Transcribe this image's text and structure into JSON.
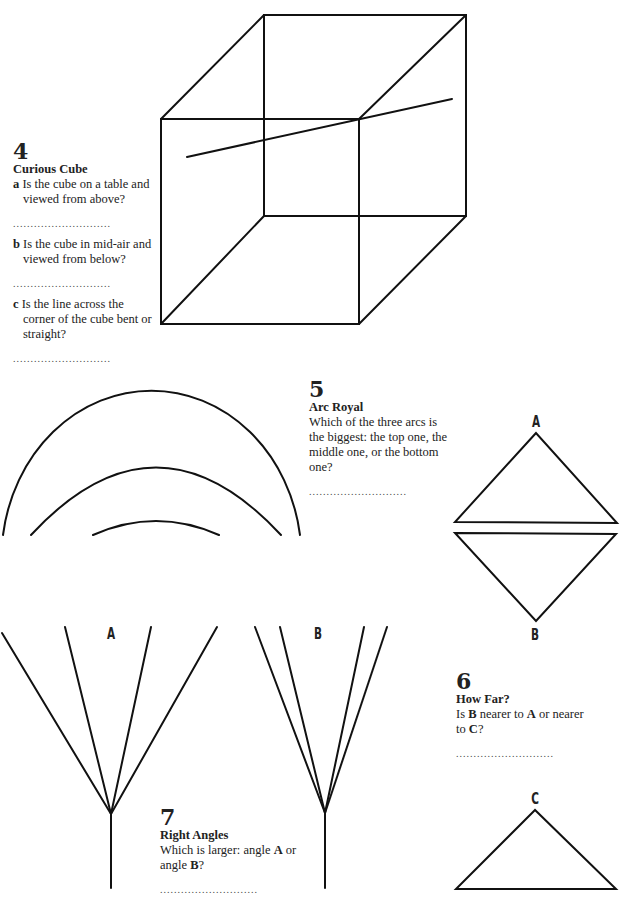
{
  "puzzles": {
    "p4": {
      "number": "4",
      "title": "Curious Cube",
      "questions": [
        {
          "letter": "a",
          "text": "Is the cube on a table and viewed from above?"
        },
        {
          "letter": "b",
          "text": "Is the cube in mid-air and viewed from below?"
        },
        {
          "letter": "c",
          "text": "Is the line across the corner of the cube bent or straight?"
        }
      ],
      "answer_line": "............................"
    },
    "p5": {
      "number": "5",
      "title": "Arc Royal",
      "question": "Which of the three arcs is the biggest: the top one, the middle one, or the bottom one?",
      "answer_line": "............................"
    },
    "p6": {
      "number": "6",
      "title": "How Far?",
      "question_parts": [
        "Is ",
        "B",
        " nearer to ",
        "A",
        " or nearer to ",
        "C",
        "?"
      ],
      "answer_line": "............................",
      "labels": {
        "a": "A",
        "b": "B",
        "c": "C"
      }
    },
    "p7": {
      "number": "7",
      "title": "Right Angles",
      "question_parts": [
        "Which is larger: angle ",
        "A",
        " or angle ",
        "B",
        "?"
      ],
      "answer_line": "............................",
      "labels": {
        "a": "A",
        "b": "B"
      }
    }
  }
}
